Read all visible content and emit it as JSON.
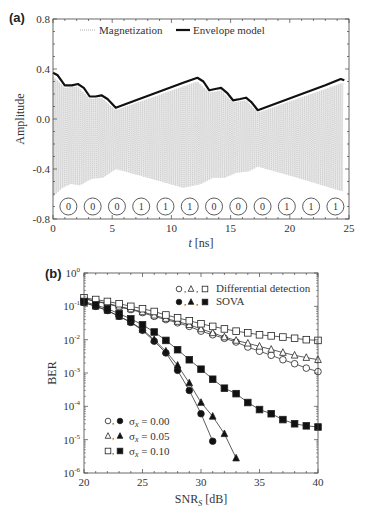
{
  "panel_labels": {
    "a": "(a)",
    "b": "(b)"
  },
  "chart_data": [
    {
      "id": "a",
      "type": "line",
      "xlabel": "t [ns]",
      "xlabel_italic": "t",
      "xlabel_unit": " [ns]",
      "ylabel": "Amplitude",
      "xlim": [
        0,
        25
      ],
      "ylim": [
        -0.8,
        0.8
      ],
      "xticks": [
        0,
        5,
        10,
        15,
        20,
        25
      ],
      "xtick_labels": [
        "0",
        "5",
        "10",
        "15",
        "20",
        "25"
      ],
      "yticks": [
        -0.8,
        -0.4,
        0.0,
        0.4,
        0.8
      ],
      "ytick_labels": [
        "-0.8",
        "-0.4",
        "0.0",
        "0.4",
        "0.8"
      ],
      "grid": false,
      "legend": {
        "position": "top",
        "entries": [
          {
            "label": "Magnetization",
            "style": "dotted",
            "color": "#9a9a9a"
          },
          {
            "label": "Envelope model",
            "style": "solid-thick",
            "color": "#111111"
          }
        ]
      },
      "series": [
        {
          "name": "Envelope model",
          "x": [
            0,
            0.4,
            1.0,
            1.6,
            2.1,
            2.6,
            3.1,
            3.6,
            4.1,
            4.6,
            5.3,
            7,
            9,
            11,
            12.2,
            12.7,
            13.2,
            13.7,
            14.2,
            14.7,
            15.2,
            15.8,
            16.3,
            16.8,
            17.3,
            19,
            21,
            23,
            24.3,
            24.6
          ],
          "y": [
            0.37,
            0.35,
            0.27,
            0.27,
            0.28,
            0.25,
            0.18,
            0.18,
            0.19,
            0.16,
            0.09,
            0.15,
            0.22,
            0.29,
            0.33,
            0.3,
            0.23,
            0.24,
            0.25,
            0.21,
            0.15,
            0.16,
            0.17,
            0.13,
            0.07,
            0.13,
            0.2,
            0.27,
            0.32,
            0.31
          ]
        },
        {
          "name": "Magnetization (upper envelope)",
          "x": [
            0,
            1.0,
            2.1,
            3.1,
            4.1,
            5.3,
            12.2,
            13.2,
            14.2,
            15.2,
            16.3,
            17.3,
            24.5
          ],
          "y": [
            0.34,
            0.25,
            0.26,
            0.16,
            0.17,
            0.07,
            0.3,
            0.21,
            0.23,
            0.13,
            0.15,
            0.05,
            0.29
          ]
        },
        {
          "name": "Magnetization (lower envelope)",
          "x": [
            0,
            0.8,
            1.5,
            2.3,
            3.2,
            4.2,
            5.3,
            8,
            11,
            12.5,
            13.5,
            14.5,
            15.5,
            16.5,
            17.3,
            21,
            24.5
          ],
          "y": [
            -0.62,
            -0.55,
            -0.52,
            -0.53,
            -0.48,
            -0.47,
            -0.4,
            -0.47,
            -0.55,
            -0.52,
            -0.47,
            -0.47,
            -0.43,
            -0.42,
            -0.38,
            -0.48,
            -0.58
          ]
        }
      ],
      "annotations": {
        "bits": [
          "0",
          "0",
          "0",
          "1",
          "1",
          "1",
          "0",
          "0",
          "0",
          "1",
          "1",
          "1"
        ],
        "bit_centers_t": [
          1.3,
          3.35,
          5.4,
          7.45,
          9.5,
          11.55,
          13.6,
          15.65,
          17.7,
          19.75,
          21.8,
          23.85
        ],
        "bit_y": -0.7
      }
    },
    {
      "id": "b",
      "type": "line",
      "xlabel": "SNRS [dB]",
      "xlabel_main": "SNR",
      "xlabel_sub": "S",
      "xlabel_unit": " [dB]",
      "ylabel": "BER",
      "yscale": "log",
      "xlim": [
        20,
        40
      ],
      "ylim": [
        1e-06,
        1
      ],
      "xticks": [
        20,
        25,
        30,
        35,
        40
      ],
      "xtick_labels": [
        "20",
        "25",
        "30",
        "35",
        "40"
      ],
      "yticks_exp": [
        0,
        -1,
        -2,
        -3,
        -4,
        -5,
        -6
      ],
      "ytick_base": "10",
      "grid": false,
      "legend": {
        "position": "top-right",
        "entries": [
          {
            "markers": "○, △, □",
            "label": "Differential detection"
          },
          {
            "markers": "●, ▲, ■",
            "label": "SOVA"
          }
        ]
      },
      "legend2": {
        "position": "bottom-left",
        "entries": [
          {
            "markers": "○, ●",
            "sym": "σ",
            "sub": "x",
            "label": " = 0.00"
          },
          {
            "markers": "△, ▲",
            "sym": "σ",
            "sub": "x",
            "label": " = 0.05"
          },
          {
            "markers": "□, ■",
            "sym": "σ",
            "sub": "x",
            "label": " = 0.10"
          }
        ]
      },
      "series": [
        {
          "name": "Differential detection, σx = 0.00",
          "marker": "circle",
          "filled": false,
          "x": [
            20,
            21,
            22,
            23,
            24,
            25,
            26,
            27,
            28,
            29,
            30,
            31,
            32,
            33,
            34,
            35,
            36,
            37,
            38,
            39,
            40
          ],
          "y": [
            0.17,
            0.14,
            0.12,
            0.095,
            0.08,
            0.065,
            0.05,
            0.04,
            0.032,
            0.025,
            0.018,
            0.014,
            0.011,
            0.0085,
            0.006,
            0.0045,
            0.0034,
            0.0025,
            0.0019,
            0.0014,
            0.0011
          ]
        },
        {
          "name": "Differential detection, σx = 0.05",
          "marker": "triangle",
          "filled": false,
          "x": [
            20,
            21,
            22,
            23,
            24,
            25,
            26,
            27,
            28,
            29,
            30,
            31,
            32,
            33,
            34,
            35,
            36,
            37,
            38,
            39,
            40
          ],
          "y": [
            0.17,
            0.145,
            0.122,
            0.1,
            0.083,
            0.068,
            0.054,
            0.043,
            0.035,
            0.028,
            0.021,
            0.016,
            0.012,
            0.0095,
            0.0078,
            0.0063,
            0.0051,
            0.0041,
            0.0034,
            0.0029,
            0.0025
          ]
        },
        {
          "name": "Differential detection, σx = 0.10",
          "marker": "square",
          "filled": false,
          "x": [
            20,
            21,
            22,
            23,
            24,
            25,
            26,
            27,
            28,
            29,
            30,
            31,
            32,
            33,
            34,
            35,
            36,
            37,
            38,
            39,
            40
          ],
          "y": [
            0.18,
            0.16,
            0.14,
            0.12,
            0.1,
            0.085,
            0.07,
            0.055,
            0.045,
            0.037,
            0.03,
            0.025,
            0.021,
            0.018,
            0.016,
            0.014,
            0.013,
            0.012,
            0.011,
            0.01,
            0.0095
          ]
        },
        {
          "name": "SOVA, σx = 0.00",
          "marker": "circle",
          "filled": true,
          "x": [
            20,
            21,
            22,
            23,
            24,
            25,
            26,
            27,
            28,
            29,
            30,
            31
          ],
          "y": [
            0.13,
            0.1,
            0.075,
            0.05,
            0.033,
            0.019,
            0.009,
            0.004,
            0.0012,
            0.0003,
            6e-05,
            9e-06
          ]
        },
        {
          "name": "SOVA, σx = 0.05",
          "marker": "triangle",
          "filled": true,
          "x": [
            20,
            21,
            22,
            23,
            24,
            25,
            26,
            27,
            28,
            29,
            30,
            31,
            32,
            33
          ],
          "y": [
            0.13,
            0.1,
            0.075,
            0.05,
            0.034,
            0.02,
            0.01,
            0.0045,
            0.0017,
            0.0005,
            0.00013,
            5e-05,
            1.5e-05,
            2.8e-06
          ]
        },
        {
          "name": "SOVA, σx = 0.10",
          "marker": "square",
          "filled": true,
          "x": [
            20,
            21,
            22,
            23,
            24,
            25,
            26,
            27,
            28,
            29,
            30,
            31,
            32,
            33,
            34,
            35,
            36,
            37,
            38,
            39,
            40
          ],
          "y": [
            0.14,
            0.11,
            0.085,
            0.06,
            0.042,
            0.028,
            0.017,
            0.0095,
            0.005,
            0.0025,
            0.0013,
            0.00065,
            0.00035,
            0.00024,
            0.00013,
            8e-05,
            6e-05,
            4e-05,
            3e-05,
            2.6e-05,
            2.4e-05
          ]
        }
      ]
    }
  ]
}
